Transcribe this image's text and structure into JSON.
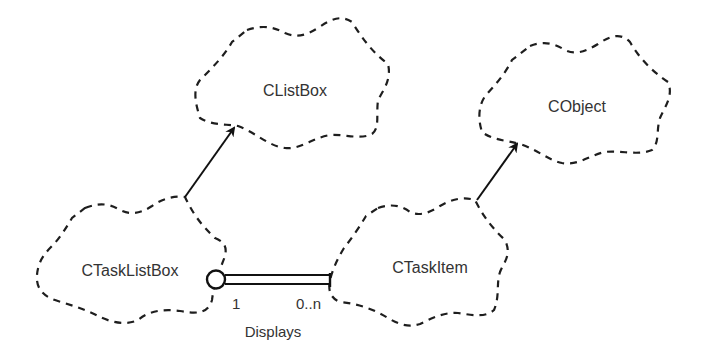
{
  "diagram": {
    "notation": "Booch class diagram",
    "classes": [
      {
        "id": "clistbox",
        "name": "CListBox"
      },
      {
        "id": "cobject",
        "name": "CObject"
      },
      {
        "id": "ctasklistbox",
        "name": "CTaskListBox"
      },
      {
        "id": "ctaskitem",
        "name": "CTaskItem"
      }
    ],
    "inheritance": [
      {
        "from": "CTaskListBox",
        "to": "CListBox"
      },
      {
        "from": "CTaskItem",
        "to": "CObject"
      }
    ],
    "association": {
      "from": "CTaskListBox",
      "to": "CTaskItem",
      "type": "has (containment)",
      "label": "Displays",
      "multiplicity_from": "1",
      "multiplicity_to": "0..n"
    }
  }
}
